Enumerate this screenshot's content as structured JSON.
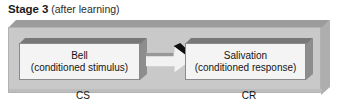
{
  "figure": {
    "caption": {
      "stage_label": "Stage 3",
      "qualifier": "(after learning)"
    },
    "colors": {
      "panel_face": "#c9c9c9",
      "panel_top_bevel": "#9c9c9c",
      "panel_side_bevel": "#aeaeae",
      "node_face": "#f4f4f4",
      "node_top_bevel": "#787878",
      "node_side_bevel": "#8d8d8d",
      "arrow_body": "#f2f2f2",
      "arrow_bevel": "#989898",
      "arrow_shadow": "#101010",
      "text": "#141414",
      "background": "#ffffff"
    },
    "nodes": [
      {
        "id": "cs",
        "line1": "Bell",
        "line2": "(conditioned stimulus)",
        "sublabel": "CS"
      },
      {
        "id": "cr",
        "line1": "Salivation",
        "line2": "(conditioned response)",
        "sublabel": "CR"
      }
    ],
    "arrow": {
      "direction": "right",
      "from": "CS",
      "to": "CR"
    }
  }
}
